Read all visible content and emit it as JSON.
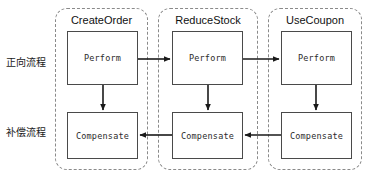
{
  "diagram": {
    "row_labels": [
      {
        "name": "forward",
        "text": "正向流程"
      },
      {
        "name": "compensate",
        "text": "补偿流程"
      }
    ],
    "lanes": [
      {
        "id": "create-order",
        "title": "CreateOrder",
        "perform_label": "Perform",
        "compensate_label": "Compensate"
      },
      {
        "id": "reduce-stock",
        "title": "ReduceStock",
        "perform_label": "Perform",
        "compensate_label": "Compensate"
      },
      {
        "id": "use-coupon",
        "title": "UseCoupon",
        "perform_label": "Perform",
        "compensate_label": "Compensate"
      }
    ],
    "edges": [
      {
        "name": "perform-0-to-perform-1",
        "direction": "right"
      },
      {
        "name": "perform-1-to-perform-2",
        "direction": "right"
      },
      {
        "name": "perform-0-to-compensate-0",
        "direction": "down"
      },
      {
        "name": "perform-1-to-compensate-1",
        "direction": "down"
      },
      {
        "name": "perform-2-to-compensate-2",
        "direction": "down"
      },
      {
        "name": "compensate-1-to-compensate-0",
        "direction": "left"
      },
      {
        "name": "compensate-2-to-compensate-1",
        "direction": "left"
      }
    ],
    "colors": {
      "background": "#ffffff",
      "lane_border": "#8a8a8a",
      "node_border": "#4a4a4a",
      "edge": "#1a1a1a",
      "text": "#1a1a1a"
    }
  }
}
